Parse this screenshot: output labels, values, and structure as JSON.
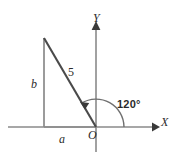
{
  "figure": {
    "kind": "geometry-diagram",
    "background_color": "#ffffff",
    "axes": {
      "x_label": "X",
      "y_label": "Y",
      "origin_label": "O",
      "axis_color": "#8a8a8a",
      "arrow_color": "#3a3a3a"
    },
    "triangle": {
      "leg_vertical_label": "b",
      "leg_horizontal_label": "a",
      "hypotenuse_label": "5",
      "leg_color": "#8a8a8a",
      "hypotenuse_color": "#4a4a4a"
    },
    "angle": {
      "label": "120°",
      "arc_color": "#6f6f6f",
      "text_color": "#2b2b2b"
    }
  }
}
